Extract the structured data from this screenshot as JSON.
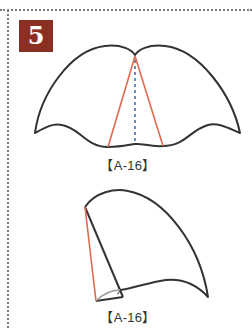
{
  "step": {
    "number": "5",
    "badge_color": "#8b2f22"
  },
  "figures": [
    {
      "id": "unfolded",
      "label": "【A-16】",
      "outline_color": "#333333",
      "fold_line_color": "#e06a4e",
      "center_line_color": "#4f6fa8",
      "center_line_style": "dashed"
    },
    {
      "id": "folded",
      "label": "【A-16】",
      "outline_color": "#333333",
      "fold_line_color": "#e06a4e",
      "flap_shade_color": "#9a9a9a"
    }
  ],
  "colors": {
    "border_dots": "#7a7a7a",
    "background": "#ffffff"
  }
}
